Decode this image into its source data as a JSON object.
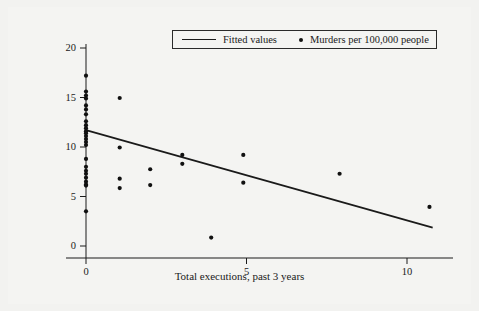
{
  "chart_data": {
    "type": "scatter",
    "title": "",
    "subtitle": "",
    "xlabel": "Total executions, past 3 years",
    "ylabel": "",
    "xlim": [
      -0.65,
      12.2
    ],
    "ylim": [
      -1.7,
      21.6
    ],
    "xticks": [
      0,
      5,
      10
    ],
    "xtick_labels": [
      "0",
      "5",
      "10"
    ],
    "yticks": [
      0,
      5,
      10,
      15,
      20
    ],
    "ytick_labels": [
      "0",
      "5",
      "10",
      "15",
      "20"
    ],
    "grid": false,
    "legend_position": "top-center",
    "legend": [
      {
        "label": "Fitted values",
        "marker": "line",
        "color": "#1a1a1a"
      },
      {
        "label": "Murders per 100,000 people",
        "marker": "dot",
        "color": "#111111"
      }
    ],
    "series": [
      {
        "name": "Murders per 100,000 people",
        "type": "scatter",
        "marker": "dot",
        "color": "#111111",
        "points": [
          [
            0,
            17.2
          ],
          [
            0,
            15.6
          ],
          [
            0,
            15.2
          ],
          [
            0,
            14.9
          ],
          [
            0,
            14.2
          ],
          [
            0,
            13.8
          ],
          [
            0,
            13.3
          ],
          [
            0,
            12.6
          ],
          [
            0,
            12.2
          ],
          [
            0,
            11.9
          ],
          [
            0,
            11.6
          ],
          [
            0,
            11.4
          ],
          [
            0,
            11.1
          ],
          [
            0,
            10.8
          ],
          [
            0,
            10.5
          ],
          [
            0,
            10.2
          ],
          [
            0,
            8.8
          ],
          [
            0,
            8.0
          ],
          [
            0,
            7.6
          ],
          [
            0,
            7.3
          ],
          [
            0,
            6.9
          ],
          [
            0,
            6.5
          ],
          [
            0,
            6.2
          ],
          [
            0,
            6.1
          ],
          [
            0,
            3.5
          ],
          [
            1.05,
            14.95
          ],
          [
            1.05,
            9.95
          ],
          [
            1.05,
            6.8
          ],
          [
            1.05,
            5.85
          ],
          [
            2.0,
            7.75
          ],
          [
            2.0,
            6.15
          ],
          [
            3.0,
            9.2
          ],
          [
            3.0,
            8.3
          ],
          [
            3.9,
            0.85
          ],
          [
            4.9,
            9.2
          ],
          [
            4.9,
            6.4
          ],
          [
            7.9,
            7.3
          ],
          [
            10.7,
            3.95
          ]
        ]
      },
      {
        "name": "Fitted values",
        "type": "line",
        "color": "#1a1a1a",
        "points": [
          [
            0,
            11.7
          ],
          [
            10.8,
            1.85
          ]
        ]
      }
    ]
  },
  "axes": {
    "x_title": "Total executions, past 3 years"
  }
}
